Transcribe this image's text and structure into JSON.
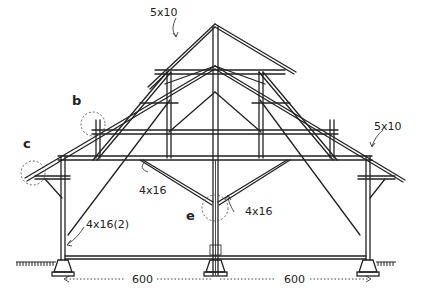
{
  "diagram": {
    "labels": {
      "ridge_rafter": "5x10",
      "right_rafter": "5x10",
      "tie_beam": "4x16",
      "strut": "4x16",
      "post": "4x16(2)",
      "span_left": "600",
      "span_right": "600"
    },
    "details": {
      "b": "b",
      "c": "c",
      "e": "e"
    }
  }
}
